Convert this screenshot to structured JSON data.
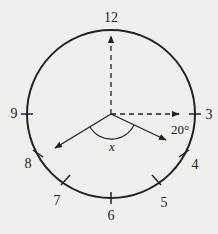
{
  "diagram": {
    "type": "clock-face-angle",
    "hour_labels": {
      "h12": "12",
      "h3": "3",
      "h4": "4",
      "h5": "5",
      "h6": "6",
      "h7": "7",
      "h8": "8",
      "h9": "9"
    },
    "angle_label": "x",
    "given_angle_label": "20°",
    "colors": {
      "background": "#efefed",
      "stroke": "#222222"
    }
  }
}
